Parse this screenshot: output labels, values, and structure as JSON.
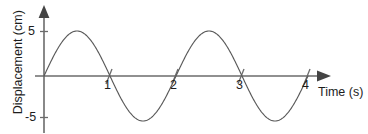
{
  "figure": {
    "name": "displacement-time-sine-wave-graph",
    "background_color": "#ffffff",
    "curve_color": "#5a5a5a",
    "axis_color": "#6b6b6b",
    "text_color": "#1d1d1d"
  },
  "axes": {
    "y_title": "Displacement (cm)",
    "x_title": "Time (s)",
    "y_ticks": [
      {
        "label": "5",
        "value": 5
      },
      {
        "label": "-5",
        "value": -5
      }
    ],
    "x_ticks": [
      {
        "label": "1",
        "value": 1
      },
      {
        "label": "2",
        "value": 2
      },
      {
        "label": "3",
        "value": 3
      },
      {
        "label": "4",
        "value": 4
      }
    ]
  },
  "chart_data": {
    "type": "line",
    "title": "",
    "xlabel": "Time (s)",
    "ylabel": "Displacement (cm)",
    "xlim": [
      0,
      4.3
    ],
    "ylim": [
      -6.5,
      6.5
    ],
    "grid": false,
    "legend": false,
    "series": [
      {
        "name": "Displacement",
        "function": "sine",
        "amplitude": 5,
        "period": 2,
        "phase": 0,
        "x": [
          0,
          0.25,
          0.5,
          0.75,
          1,
          1.25,
          1.5,
          1.75,
          2,
          2.25,
          2.5,
          2.75,
          3,
          3.25,
          3.5,
          3.75,
          4
        ],
        "values": [
          0,
          3.54,
          5,
          3.54,
          0,
          -3.54,
          -5,
          -3.54,
          0,
          3.54,
          5,
          3.54,
          0,
          -3.54,
          -5,
          -3.54,
          0
        ]
      }
    ],
    "annotations": []
  }
}
